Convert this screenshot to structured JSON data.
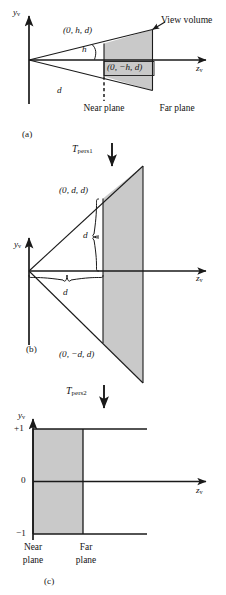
{
  "figure": {
    "caption_panels": [
      "(a)",
      "(b)",
      "(c)"
    ],
    "axes": {
      "y_axis_label": "y",
      "y_axis_subscript": "v",
      "z_axis_label": "z",
      "z_axis_subscript": "v"
    },
    "transforms": [
      {
        "symbol": "T",
        "subscript": "pers1",
        "direction": "down"
      },
      {
        "symbol": "T",
        "subscript": "pers2",
        "direction": "down"
      }
    ],
    "panel_a": {
      "id": "(a)",
      "top_corner_label": "(0, h, d)",
      "bottom_corner_label": "(0, −h, d)",
      "height_label": "h",
      "distance_label": "d",
      "view_volume_label": "View volume",
      "near_plane_label": "Near plane",
      "far_plane_label": "Far plane"
    },
    "panel_b": {
      "id": "(b)",
      "top_corner_label": "(0, d, d)",
      "bottom_corner_label": "(0, −d, d)",
      "vertical_brace_label": "d",
      "horizontal_brace_label": "d"
    },
    "panel_c": {
      "id": "(c)",
      "ticks": [
        "+1",
        "0",
        "−1"
      ],
      "near_plane_label_line1": "Near",
      "near_plane_label_line2": "plane",
      "far_plane_label_line1": "Far",
      "far_plane_label_line2": "plane"
    },
    "colors": {
      "volume_fill": "#c9c9c9",
      "stroke": "#1a1a1a",
      "background": "#ffffff"
    }
  }
}
